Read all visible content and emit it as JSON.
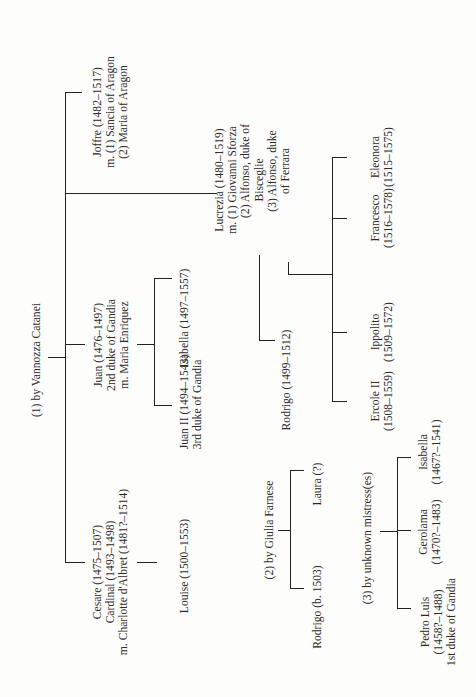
{
  "diagram": {
    "type": "family-tree",
    "orientation": "rotated-90-ccw",
    "line_color": "#222222",
    "background": "#fdfdfb"
  },
  "mothers": {
    "vannozza": "(1) by Vannozza Catanei",
    "giulia": "(2) by Giulia Farnese",
    "unknown": "(3) by unknown mistress(es)"
  },
  "people": {
    "joffre": [
      "Joffre (1482–1517)",
      "m. (1) Sancia of Aragon",
      "(2) Maria of Aragon"
    ],
    "lucrezia": [
      "Lucrezia (1480–1519)",
      "m. (1) Giovanni Sforza",
      "(2) Alfonso, duke of",
      "Bisceglie",
      "(3) Alfonso, duke",
      "of Ferrara"
    ],
    "juan": [
      "Juan (1476–1497)",
      "2nd duke of Gandia",
      "m. Maria Enriquez"
    ],
    "juan_ii": [
      "Juan II (1494–1543)",
      "3rd duke of Gandia"
    ],
    "isabella_juan": [
      "Isabella (1497–1557)"
    ],
    "cesare": [
      "Cesare (1475–1507)",
      "Cardinal (1493–1498)",
      "m. Charlotte d'Albret (1481?–1514)"
    ],
    "louise": [
      "Louise (1500–1553)"
    ],
    "rodrigo_lucrezia": [
      "Rodrigo (1499–1512)"
    ],
    "ercole": [
      "Ercole II",
      "(1508–1559)"
    ],
    "ippolito": [
      "Ippolito",
      "(1509–1572)"
    ],
    "francesco": [
      "Francesco",
      "(1516–1578)"
    ],
    "eleonora": [
      "Eleonora",
      "(1515–1575)"
    ],
    "rodrigo_giulia": [
      "Rodrigo (b. 1503)"
    ],
    "laura": [
      "Laura (?)"
    ],
    "pedro_luis": [
      "Pedro Luis",
      "(1458?–1488)",
      "1st duke of Gandia"
    ],
    "gerolama": [
      "Gerolama",
      "(1470?–1483)"
    ],
    "isabella_unknown": [
      "Isabella",
      "(1467?–1541)"
    ]
  }
}
